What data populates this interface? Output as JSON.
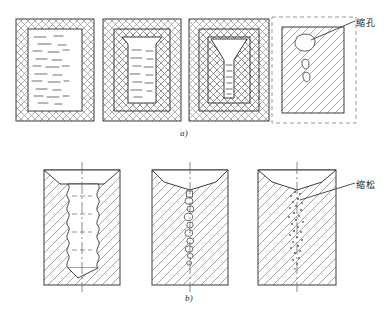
{
  "figure": {
    "captions": {
      "part_a": "a)",
      "part_b": "b)"
    },
    "annotations": [
      {
        "id": "shrinkage-cavity",
        "text": "缩孔",
        "meaning": "shrinkage cavity",
        "part": "a)",
        "points_to_stage": 4
      },
      {
        "id": "shrinkage-porosity",
        "text": "缩松",
        "meaning": "shrinkage porosity",
        "part": "b)",
        "points_to_stage": 3
      }
    ],
    "row_a": {
      "name": "缩孔形成过程",
      "stages": [
        {
          "index": 1,
          "name": "full-liquid-mold",
          "shell": "none",
          "liquid": "full",
          "top_profile": "flat",
          "defect": "none"
        },
        {
          "index": 2,
          "name": "thin-shell-solidifying",
          "shell": "thin",
          "liquid": "large",
          "top_profile": "tapered",
          "defect": "none"
        },
        {
          "index": 3,
          "name": "thick-shell-funnel",
          "shell": "thick",
          "liquid": "narrow",
          "top_profile": "funnel",
          "defect": "none"
        },
        {
          "index": 4,
          "name": "final-casting-with-cavity",
          "shell": "solid",
          "liquid": "none",
          "top_profile": "flat",
          "defect": "concentrated-cavity",
          "mold_outline": "dashed"
        }
      ]
    },
    "row_b": {
      "name": "缩松形成过程",
      "stages": [
        {
          "index": 1,
          "name": "dendritic-liquid-column",
          "boundary": "scalloped",
          "centerline": true,
          "defect": "none"
        },
        {
          "index": 2,
          "name": "void-chain-forming",
          "top_profile": "v-notch",
          "centerline": true,
          "defect": "void-chain"
        },
        {
          "index": 3,
          "name": "dispersed-microporosity",
          "top_profile": "v-notch",
          "centerline": true,
          "defect": "scattered-pores"
        }
      ]
    },
    "colors": {
      "line": "#3a3a3a",
      "hatch": "#808080",
      "liquid_dash": "#6e6e6e",
      "dashed_mold": "#9a9a9a",
      "background": "#ffffff",
      "void_fill": "#ffffff"
    }
  }
}
